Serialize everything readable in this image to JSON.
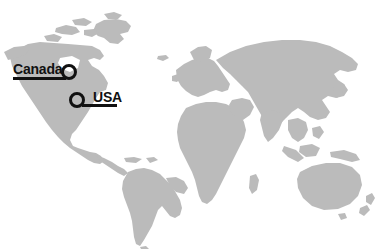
{
  "map": {
    "type": "world-map",
    "projection": "equirectangular",
    "background_color": "#ffffff",
    "land_color": "#bbbbbb",
    "width": 375,
    "height": 249,
    "continents_visible": [
      "North America",
      "South America",
      "Europe",
      "Africa",
      "Asia",
      "Australia",
      "Greenland"
    ]
  },
  "annotations": {
    "marker_color": "#111111",
    "items": [
      {
        "id": "canada",
        "label": "Canada",
        "label_side": "left",
        "marker_x": 69,
        "marker_y": 72,
        "marker_radius": 8
      },
      {
        "id": "usa",
        "label": "USA",
        "label_side": "right",
        "marker_x": 77,
        "marker_y": 100,
        "marker_radius": 8
      }
    ]
  }
}
